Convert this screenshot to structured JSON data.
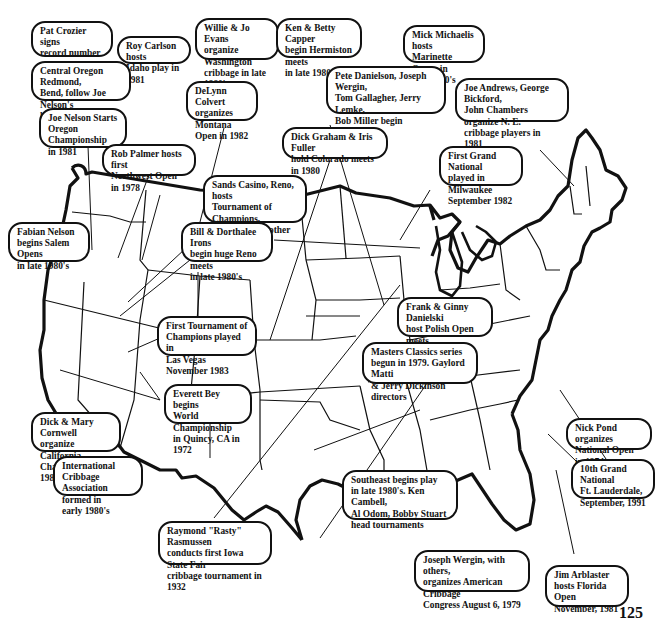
{
  "callouts": [
    {
      "id": "pat-crozier",
      "text": "Pat Crozier signs\nrecord number of\nPortland area players"
    },
    {
      "id": "roy-carlson",
      "text": "Roy Carlson hosts\nIdaho play in 1981"
    },
    {
      "id": "willie-jo-evans",
      "text": "Willie & Jo Evans\norganize Washington\ncribbage in late 1980's"
    },
    {
      "id": "ken-betty-capper",
      "text": "Ken & Betty Capper\nbegin Hermiston meets\nin late 1980's"
    },
    {
      "id": "mick-michaelis",
      "text": "Mick Michaelis hosts\nMarinette Opens in\nmid-1980's"
    },
    {
      "id": "central-oregon",
      "text": "Central Oregon  Redmond,\nBend, follow Joe Nelson's\nlead, hold large tourneys"
    },
    {
      "id": "delynn-colvert",
      "text": "DeLynn Colvert\norganizes Montana\nOpen in 1982"
    },
    {
      "id": "pete-danielson",
      "text": "Pete Danielson, Joseph Wergin,\nTom Gallagher, Jerry Lemke,\nBob Miller begin midwestern\nplay"
    },
    {
      "id": "joe-andrews",
      "text": "Joe Andrews, George Bickford,\nJohn Chambers organize N. E.\ncribbage players in 1981"
    },
    {
      "id": "joe-nelson",
      "text": "Joe Nelson Starts\nOregon Championship\nin 1981"
    },
    {
      "id": "dick-graham",
      "text": "Dick Graham & Iris Fuller\nhold Colorado meets in 1980"
    },
    {
      "id": "rob-palmer",
      "text": "Rob Palmer hosts first\nNorthwest Open in 1978"
    },
    {
      "id": "first-grand-national",
      "text": "First Grand National\nplayed in Milwaukee\nSeptember 1982"
    },
    {
      "id": "sands-casino",
      "text": "Sands Casino, Reno, hosts\nTournament of Champions,\nACC Open & other huge\ntournaments"
    },
    {
      "id": "fabian-nelson",
      "text": "Fabian Nelson\nbegins Salem Opens\nin late 1980's"
    },
    {
      "id": "bill-dorthalee-irons",
      "text": "Bill & Dorthalee Irons\nbegin huge Reno meets\nin late 1980's"
    },
    {
      "id": "frank-ginny-danielski",
      "text": "Frank & Ginny Danielski\nhost Polish Open meets\nin mid-1980's"
    },
    {
      "id": "first-toc",
      "text": "First Tournament of\nChampions played in\nLas Vegas November 1983"
    },
    {
      "id": "masters-classics",
      "text": "Masters Classics series\nbegun in 1979. Gaylord Matti\n& Jerry Dickinson directors"
    },
    {
      "id": "everett-bey",
      "text": "Everett Bey begins\nWorld Championship\nin Quincy, CA in 1972"
    },
    {
      "id": "dick-mary-cornwell",
      "text": "Dick & Mary Cornwell\norganize California\nChampionship in 1981"
    },
    {
      "id": "nick-pond",
      "text": "Nick Pond organizes\nNational Open in 1974"
    },
    {
      "id": "international-cribbage",
      "text": "International Cribbage\nAssociation formed in\nearly 1980's"
    },
    {
      "id": "tenth-grand-national",
      "text": "10th Grand National\nFt. Lauderdale,\nSeptember, 1991"
    },
    {
      "id": "southeast",
      "text": "Southeast begins play\nin late 1980's. Ken Cambell,\nAl Odom, Bobby Stuart\nhead tournaments"
    },
    {
      "id": "raymond-rasmussen",
      "text": "Raymond \"Rasty\" Rasmussen\nconducts first Iowa State Fair\ncribbage tournament in 1932"
    },
    {
      "id": "joseph-wergin",
      "text": "Joseph Wergin, with others,\norganizes American Cribbage\nCongress August 6, 1979"
    },
    {
      "id": "jim-arblaster",
      "text": "Jim Arblaster\nhosts Florida Open\nNovember, 1981"
    }
  ],
  "page_number": "125",
  "colors": {
    "ink": "#111111",
    "paper": "#ffffff"
  }
}
